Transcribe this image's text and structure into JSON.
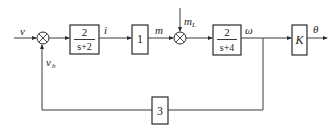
{
  "diagram": {
    "type": "control-system-block-diagram",
    "signals": {
      "input": "v",
      "feedback": "v",
      "feedback_sub": "b",
      "current": "i",
      "torque": "m",
      "disturbance": "m",
      "disturbance_sub": "L",
      "speed": "ω",
      "output": "θ"
    },
    "blocks": {
      "block1": {
        "numerator": "2",
        "denominator": "s+2"
      },
      "block2": {
        "value": "1"
      },
      "block3": {
        "numerator": "2",
        "denominator": "s+4"
      },
      "block4": {
        "value": "K"
      },
      "feedback_block": {
        "value": "3"
      }
    },
    "summing_junctions": [
      {
        "id": "sum1",
        "inputs": [
          "v",
          "v_b"
        ]
      },
      {
        "id": "sum2",
        "inputs": [
          "m",
          "m_L"
        ]
      }
    ]
  }
}
